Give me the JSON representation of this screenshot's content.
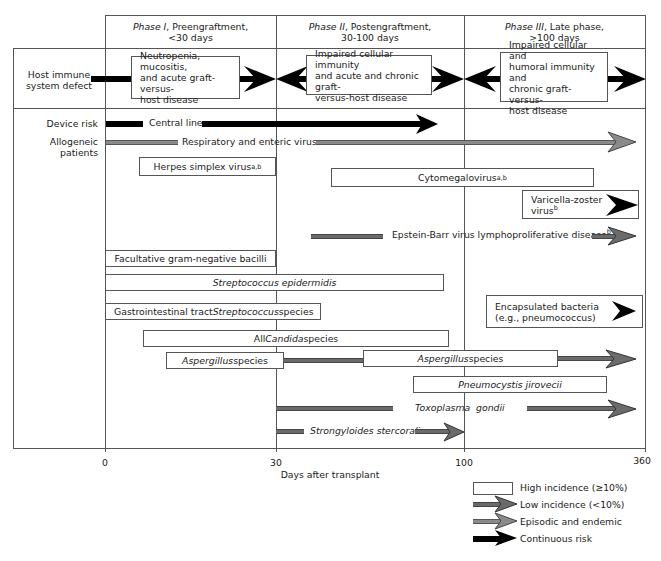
{
  "phases": [
    {
      "roman": "Phase I",
      "rest": ", Preengraftment,",
      "range": "<30 days"
    },
    {
      "roman": "Phase II",
      "rest": ", Postengraftment,",
      "range": "30-100 days"
    },
    {
      "roman": "Phase III",
      "rest": ", Late phase,",
      "range": ">100 days"
    }
  ],
  "row_labels": {
    "host_immune_line1": "Host immune",
    "host_immune_line2": "system defect",
    "device_risk": "Device risk",
    "allogeneic_line1": "Allogeneic",
    "allogeneic_line2": "patients"
  },
  "immune_defects": [
    {
      "lines": [
        "Neutropenia, mucositis,",
        "and acute graft-versus-",
        "host disease"
      ]
    },
    {
      "lines": [
        "Impaired cellular immunity",
        "and acute and chronic graft-",
        "versus-host disease"
      ]
    },
    {
      "lines": [
        "Impaired cellular and",
        "humoral immunity and",
        "chronic graft-versus-",
        "host disease"
      ]
    }
  ],
  "pathogens": {
    "central_line": "Central line",
    "resp_enteric": "Respiratory and enteric viruses",
    "hsv": "Herpes simplex virus",
    "hsv_sup": "a,b",
    "cmv": "Cytomegalovirus",
    "cmv_sup": "a,b",
    "vzv_line1": "Varicella-zoster",
    "vzv_line2": "virus",
    "vzv_sup": "b",
    "ebv": "Epstein-Barr virus lymphoproliferative disease",
    "ebv_sup": "b",
    "gram_neg": "Facultative gram-negative bacilli",
    "strep_epi": "Streptococcus epidermidis",
    "gi_strep_pre": "Gastrointestinal tract ",
    "gi_strep_it": "Streptococcus",
    "gi_strep_post": " species",
    "encaps_line1": "Encapsulated bacteria",
    "encaps_line2": "(e.g., pneumococcus)",
    "candida_pre": "All ",
    "candida_it": "Candida",
    "candida_post": " species",
    "asper1_it": "Aspergillus",
    "asper1_post": " species",
    "asper2_it": "Aspergillus",
    "asper2_post": " species",
    "pneumocystis": "Pneumocystis jirovecii",
    "toxo_a": "Toxoplasma",
    "toxo_b": "gondii",
    "strongyloides": "Strongyloides stercoralis"
  },
  "axis": {
    "ticks": [
      "0",
      "30",
      "100",
      "360"
    ],
    "label": "Days after transplant"
  },
  "legend": [
    {
      "label": "High incidence (≥10%)",
      "style": "box"
    },
    {
      "label": "Low incidence (<10%)",
      "style": "dark-gray-arrow"
    },
    {
      "label": "Episodic and endemic",
      "style": "light-gray-arrow"
    },
    {
      "label": "Continuous risk",
      "style": "black-arrow"
    }
  ],
  "colors": {
    "black": "#000000",
    "dark_gray": "#6b6b6b",
    "light_gray": "#8a8a8a",
    "grid": "#555555"
  }
}
